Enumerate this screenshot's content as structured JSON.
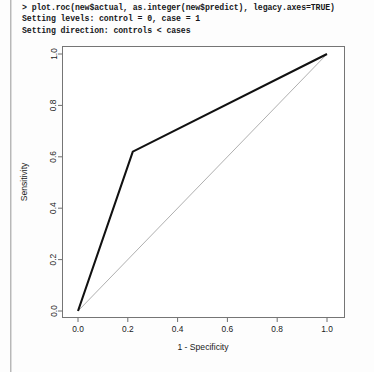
{
  "console": {
    "lines": [
      "> plot.roc(new$actual, as.integer(new$predict), legacy.axes=TRUE)",
      "Setting levels: control = 0, case = 1",
      "Setting direction: controls < cases"
    ]
  },
  "chart_data": {
    "type": "line",
    "title": "",
    "xlabel": "1 - Specificity",
    "ylabel": "Sensitivity",
    "xlim": [
      0.0,
      1.0
    ],
    "ylim": [
      0.0,
      1.0
    ],
    "xticks": [
      "0.0",
      "0.2",
      "0.4",
      "0.6",
      "0.8",
      "1.0"
    ],
    "xtickvalues": [
      0.0,
      0.2,
      0.4,
      0.6,
      0.8,
      1.0
    ],
    "yticks": [
      "0.0",
      "0.2",
      "0.4",
      "0.6",
      "0.8",
      "1.0"
    ],
    "ytickvalues": [
      0.0,
      0.2,
      0.4,
      0.6,
      0.8,
      1.0
    ],
    "grid": false,
    "legend": "none",
    "series": [
      {
        "name": "ROC curve",
        "color": "#111111",
        "width": 2.1,
        "x": [
          0.0,
          0.22,
          1.0
        ],
        "y": [
          0.0,
          0.62,
          1.0
        ]
      },
      {
        "name": "chance diagonal",
        "color": "#9a9a9a",
        "width": 0.8,
        "x": [
          0.0,
          1.0
        ],
        "y": [
          0.0,
          1.0
        ]
      }
    ]
  },
  "colors": {
    "curve": "#111111",
    "diagonal": "#9a9a9a",
    "axis": "#6e6e6e",
    "text": "#1a1a1a",
    "page": "#fdfdfd"
  }
}
